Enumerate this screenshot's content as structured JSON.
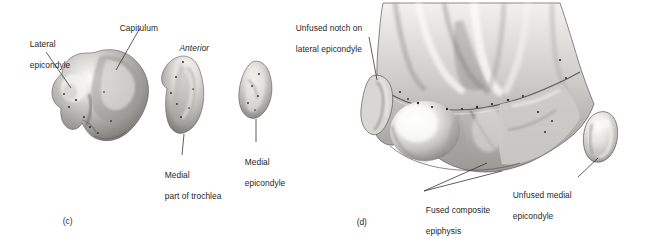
{
  "figure": {
    "caption_panels": [
      {
        "id": "panel-c",
        "label": "(c)",
        "x": 58,
        "y": 206
      },
      {
        "id": "panel-d",
        "label": "(d)",
        "x": 352,
        "y": 207
      }
    ],
    "orientation_note": {
      "text": "Anterior",
      "x": 175,
      "y": 33
    },
    "labels": [
      {
        "name": "lateral-epicondyle",
        "line1": "Lateral",
        "line2": "epicondyle",
        "x": 25,
        "y": 29
      },
      {
        "name": "capitulum",
        "line1": "Capitulum",
        "line2": "",
        "x": 115,
        "y": 13
      },
      {
        "name": "medial-part-of-trochlea",
        "line1": "Medial",
        "line2": "part of trochlea",
        "x": 160,
        "y": 160
      },
      {
        "name": "medial-epicondyle",
        "line1": "Medial",
        "line2": "epicondyle",
        "x": 240,
        "y": 147
      },
      {
        "name": "unfused-notch-on-lateral-epicondyle",
        "line1": "Unfused notch on",
        "line2": "lateral epicondyle",
        "x": 291,
        "y": 13
      },
      {
        "name": "fused-composite-epiphysis",
        "line1": "Fused composite",
        "line2": "epiphysis",
        "x": 421,
        "y": 195
      },
      {
        "name": "unfused-medial-epicondyle",
        "line1": "Unfused medial",
        "line2": "epicondyle",
        "x": 508,
        "y": 180
      }
    ],
    "specimens": [
      {
        "name": "lateral-condyle-fragment",
        "panel": "c",
        "description": "Large irregular bone fragment, lateral epicondyle and capitulum"
      },
      {
        "name": "medial-trochlea-fragment",
        "panel": "c",
        "description": "Crescent shaped medial part of trochlea"
      },
      {
        "name": "medial-epicondyle-fragment",
        "panel": "c",
        "description": "Small oval medial epicondyle"
      },
      {
        "name": "distal-humerus-specimen",
        "panel": "d",
        "description": "Distal humerus with fused composite epiphysis"
      },
      {
        "name": "unfused-medial-epicondyle-fragment",
        "panel": "d",
        "description": "Separate pear shaped medial epicondyle"
      }
    ],
    "colors": {
      "background": "#ffffff",
      "text": "#1f1f1f",
      "leader_line": "#2b2b2b",
      "bone_light": "#f4f3f1",
      "bone_mid": "#b9b7b4",
      "bone_dark": "#6e6c6a",
      "bone_shadow": "#4a4845"
    }
  }
}
